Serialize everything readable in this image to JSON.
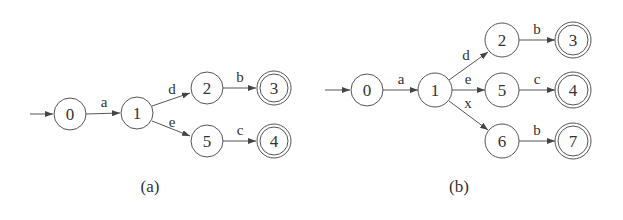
{
  "diagrams": [
    {
      "caption": "(a)",
      "start_state": "0",
      "states": [
        {
          "id": "0",
          "label": "0",
          "accepting": false
        },
        {
          "id": "1",
          "label": "1",
          "accepting": false
        },
        {
          "id": "2",
          "label": "2",
          "accepting": false
        },
        {
          "id": "3",
          "label": "3",
          "accepting": true
        },
        {
          "id": "5",
          "label": "5",
          "accepting": false
        },
        {
          "id": "4",
          "label": "4",
          "accepting": true
        }
      ],
      "transitions": [
        {
          "from": "0",
          "to": "1",
          "label": "a"
        },
        {
          "from": "1",
          "to": "2",
          "label": "d"
        },
        {
          "from": "1",
          "to": "5",
          "label": "e"
        },
        {
          "from": "2",
          "to": "3",
          "label": "b"
        },
        {
          "from": "5",
          "to": "4",
          "label": "c"
        }
      ]
    },
    {
      "caption": "(b)",
      "start_state": "0",
      "states": [
        {
          "id": "0",
          "label": "0",
          "accepting": false
        },
        {
          "id": "1",
          "label": "1",
          "accepting": false
        },
        {
          "id": "2",
          "label": "2",
          "accepting": false
        },
        {
          "id": "3",
          "label": "3",
          "accepting": true
        },
        {
          "id": "5",
          "label": "5",
          "accepting": false
        },
        {
          "id": "4",
          "label": "4",
          "accepting": true
        },
        {
          "id": "6",
          "label": "6",
          "accepting": false
        },
        {
          "id": "7",
          "label": "7",
          "accepting": true
        }
      ],
      "transitions": [
        {
          "from": "0",
          "to": "1",
          "label": "a"
        },
        {
          "from": "1",
          "to": "2",
          "label": "d"
        },
        {
          "from": "1",
          "to": "5",
          "label": "e"
        },
        {
          "from": "1",
          "to": "6",
          "label": "x"
        },
        {
          "from": "2",
          "to": "3",
          "label": "b"
        },
        {
          "from": "5",
          "to": "4",
          "label": "c"
        },
        {
          "from": "6",
          "to": "7",
          "label": "b"
        }
      ]
    }
  ]
}
